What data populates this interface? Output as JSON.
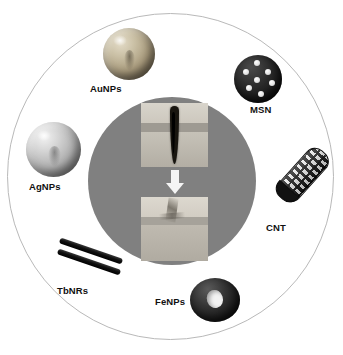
{
  "figure": {
    "type": "circular-infographic",
    "background_color": "#ffffff",
    "outer_ring_color": "#b9b9b9",
    "core_disc_color": "#808080",
    "arrow_color": "#f4f4f4"
  },
  "center": {
    "process_arrow": "downward-arrow",
    "panels": [
      {
        "id": "wounded-tissue",
        "caption": "",
        "state": "wounded",
        "description": "skin tissue cross-section with open incision"
      },
      {
        "id": "healed-tissue",
        "caption": "",
        "state": "healed",
        "description": "skin tissue cross-section after wound closure"
      }
    ]
  },
  "nanomaterials": [
    {
      "id": "aunps",
      "label": "AuNPs",
      "shape": "sphere",
      "color": "#a89a7c"
    },
    {
      "id": "msn",
      "label": "MSN",
      "shape": "porous-sphere",
      "color": "#141414"
    },
    {
      "id": "cnt",
      "label": "CNT",
      "shape": "nanotube",
      "color": "#111111"
    },
    {
      "id": "fenps",
      "label": "FeNPs",
      "shape": "torus",
      "color": "#171717"
    },
    {
      "id": "tbnrs",
      "label": "TbNRs",
      "shape": "nanorods",
      "color": "#000000"
    },
    {
      "id": "agnps",
      "label": "AgNPs",
      "shape": "sphere",
      "color": "#b0b0b0"
    }
  ]
}
